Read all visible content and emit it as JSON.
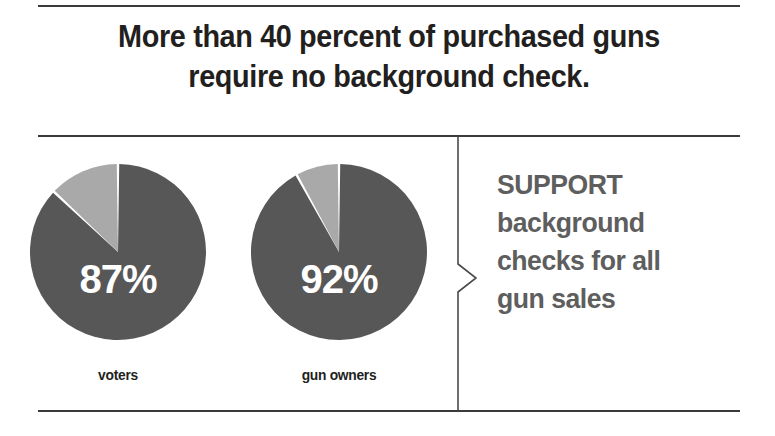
{
  "headline": {
    "line1": "More than 40 percent of purchased guns",
    "line2": "require no background check."
  },
  "caption": {
    "line1": "SUPPORT",
    "line2": "background",
    "line3": "checks for all",
    "line4": "gun sales"
  },
  "colors": {
    "dark_slice": "#575757",
    "light_slice": "#a9a9a9",
    "rule": "#3a3a3a",
    "headline_text": "#231f20",
    "caption_text": "#5e5e5e",
    "value_text": "#ffffff",
    "background": "#ffffff"
  },
  "chart_data": [
    {
      "type": "pie",
      "title": "voters",
      "label": "voters",
      "value_label": "87%",
      "categories": [
        "support background checks",
        "do not support"
      ],
      "values": [
        87,
        13
      ],
      "colors": [
        "#575757",
        "#a9a9a9"
      ],
      "start_angle_deg": 0,
      "direction": "clockwise",
      "legend": "none"
    },
    {
      "type": "pie",
      "title": "gun owners",
      "label": "gun owners",
      "value_label": "92%",
      "categories": [
        "support background checks",
        "do not support"
      ],
      "values": [
        92,
        8
      ],
      "colors": [
        "#575757",
        "#a9a9a9"
      ],
      "start_angle_deg": 0,
      "direction": "clockwise",
      "legend": "none"
    }
  ]
}
